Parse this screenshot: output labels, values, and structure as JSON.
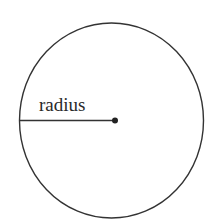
{
  "diagram": {
    "type": "circle",
    "label": "radius",
    "colors": {
      "stroke": "#333333",
      "background": "#ffffff"
    }
  }
}
